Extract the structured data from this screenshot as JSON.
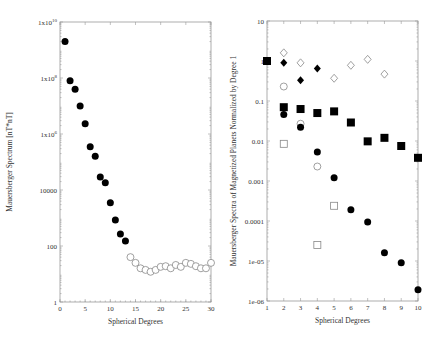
{
  "chart_data": [
    {
      "type": "scatter",
      "title": "",
      "xlabel": "Spherical Degrees",
      "ylabel": "Mauersberger Spectrum [nT*nT]",
      "xlim": [
        0,
        30
      ],
      "ylim": [
        1,
        10000000000
      ],
      "yscale": "log",
      "grid": false,
      "legend": null,
      "x_ticks": [
        "0",
        "5",
        "10",
        "15",
        "20",
        "25",
        "30"
      ],
      "y_ticks": [
        {
          "value": 10000000000,
          "label": "1x10",
          "exp": "10"
        },
        {
          "value": 100000000,
          "label": "1x10",
          "exp": "8"
        },
        {
          "value": 1000000,
          "label": "1x10",
          "exp": "6"
        },
        {
          "value": 10000,
          "label": "10000",
          "exp": ""
        },
        {
          "value": 100,
          "label": "100",
          "exp": ""
        },
        {
          "value": 1,
          "label": "1",
          "exp": ""
        }
      ],
      "series": [
        {
          "name": "core field (filled circles)",
          "marker": "filled-circle",
          "x": [
            1,
            2,
            3,
            4,
            5,
            6,
            7,
            8,
            9,
            10,
            11,
            12,
            13
          ],
          "y": [
            2000000000,
            80000000,
            40000000,
            10000000,
            2300000,
            350000,
            160000,
            29000,
            18000,
            3500,
            850,
            270,
            150
          ]
        },
        {
          "name": "crustal field (open circles)",
          "marker": "open-circle",
          "x": [
            14,
            15,
            16,
            17,
            18,
            19,
            20,
            21,
            22,
            23,
            24,
            25,
            26,
            27,
            28,
            29,
            30
          ],
          "y": [
            40,
            25,
            16,
            14,
            12,
            14,
            18,
            19,
            16,
            21,
            18,
            25,
            23,
            19,
            16,
            16,
            25
          ]
        }
      ]
    },
    {
      "type": "scatter",
      "title": "",
      "xlabel": "Spherical Degrees",
      "ylabel": "Mauersberger Spectra of Magnetized Planets Normalized by Degree 1",
      "xlim": [
        1,
        10
      ],
      "ylim": [
        1e-06,
        10
      ],
      "yscale": "log",
      "grid": false,
      "legend": null,
      "x_ticks": [
        "1",
        "2",
        "3",
        "4",
        "5",
        "6",
        "7",
        "8",
        "9",
        "10"
      ],
      "y_ticks": [
        {
          "value": 10,
          "label": "10"
        },
        {
          "value": 1,
          "label": "1"
        },
        {
          "value": 0.1,
          "label": "0.1"
        },
        {
          "value": 0.01,
          "label": "0.01"
        },
        {
          "value": 0.001,
          "label": "0.001"
        },
        {
          "value": 0.0001,
          "label": "0.0001"
        },
        {
          "value": 1e-05,
          "label": "1e-05"
        },
        {
          "value": 1e-06,
          "label": "1e-06"
        }
      ],
      "series": [
        {
          "name": "filled squares",
          "marker": "filled-square",
          "x": [
            1,
            2,
            3,
            4,
            5,
            6,
            7,
            8,
            9,
            10
          ],
          "y": [
            1,
            0.07,
            0.063,
            0.05,
            0.055,
            0.029,
            0.0098,
            0.012,
            0.0075,
            0.0038
          ]
        },
        {
          "name": "open diamonds",
          "marker": "open-diamond",
          "x": [
            2,
            3,
            5,
            6,
            7,
            8
          ],
          "y": [
            1.6,
            0.9,
            0.37,
            0.78,
            1.1,
            0.47
          ]
        },
        {
          "name": "filled diamonds",
          "marker": "filled-diamond",
          "x": [
            2,
            3,
            4
          ],
          "y": [
            0.9,
            0.33,
            0.65
          ]
        },
        {
          "name": "open circles",
          "marker": "open-circle",
          "x": [
            2,
            3,
            4
          ],
          "y": [
            0.23,
            0.027,
            0.0023
          ]
        },
        {
          "name": "filled circles",
          "marker": "filled-circle",
          "x": [
            2,
            3,
            4,
            5,
            6,
            7,
            8,
            9,
            10
          ],
          "y": [
            0.046,
            0.022,
            0.0053,
            0.0012,
            0.00019,
            9.5e-05,
            1.6e-05,
            9e-06,
            1.9e-06
          ]
        },
        {
          "name": "open squares",
          "marker": "open-square",
          "x": [
            2,
            4,
            5
          ],
          "y": [
            0.0085,
            2.5e-05,
            0.00024
          ]
        }
      ]
    }
  ],
  "layout": {
    "panels": [
      {
        "left": 60,
        "right": 211,
        "top": 22,
        "bottom": 302
      },
      {
        "left": 267,
        "right": 418,
        "top": 21,
        "bottom": 301
      }
    ]
  },
  "colors": {
    "marker": "#000000",
    "open_marker": "#888888",
    "frame": "#999999",
    "text": "#333333"
  }
}
